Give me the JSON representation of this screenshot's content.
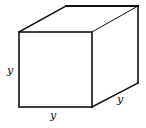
{
  "diagram": {
    "type": "cube",
    "labels": {
      "height": "y",
      "width": "y",
      "depth": "y"
    },
    "colors": {
      "stroke": "#111111",
      "background": "#ffffff"
    }
  }
}
